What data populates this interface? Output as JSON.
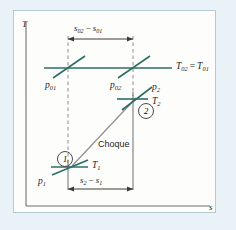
{
  "figure": {
    "kind": "thermodynamic-Ts-diagram",
    "caption_word": "Choque",
    "background_color": "#e8f2f7",
    "panel_color": "#fdfdfb",
    "line_color_isobar": "#2d6e66",
    "line_color_construction": "#6f6f6f",
    "text_color": "#1d1d1d"
  },
  "axes": {
    "y_label": "T",
    "x_label": "s"
  },
  "dimensions": {
    "top": {
      "label_full": "s02 − s01",
      "minuend": "s",
      "minuend_sub": "02",
      "operator": "−",
      "subtrahend": "s",
      "subtrahend_sub": "01"
    },
    "bottom": {
      "label_full": "s2 − s1",
      "minuend": "s",
      "minuend_sub": "2",
      "operator": "−",
      "subtrahend": "s",
      "subtrahend_sub": "1"
    }
  },
  "stagnation_line": {
    "label_lhs": "T",
    "label_lhs_sub": "02",
    "label_eq": "=",
    "label_rhs": "T",
    "label_rhs_sub": "01"
  },
  "isobars": [
    {
      "id": "p01",
      "symbol": "p",
      "sub": "01"
    },
    {
      "id": "p02",
      "symbol": "p",
      "sub": "02"
    },
    {
      "id": "p1",
      "symbol": "p",
      "sub": "1"
    },
    {
      "id": "p2",
      "symbol": "p",
      "sub": "2"
    }
  ],
  "isotherms": [
    {
      "id": "T1",
      "symbol": "T",
      "sub": "1"
    },
    {
      "id": "T2",
      "symbol": "T",
      "sub": "2"
    }
  ],
  "state_points": [
    {
      "id": "state-1",
      "marker": "1"
    },
    {
      "id": "state-2",
      "marker": "2"
    }
  ],
  "process": {
    "name": "Choque"
  }
}
